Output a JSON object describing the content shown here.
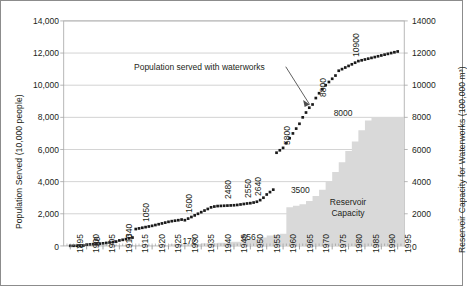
{
  "chart_data": {
    "type": "line",
    "title": "",
    "xlabel": "",
    "ylabel": "Population Served (10,000 people)",
    "y2label": "Reservoir Capacity for Waterworks (100,000 m³)",
    "xlim": [
      1893,
      1997
    ],
    "ylim": [
      0,
      14000
    ],
    "y2lim": [
      0,
      14000
    ],
    "grid": true,
    "legend_position": "none",
    "xticks": [
      "1895",
      "1900",
      "1905",
      "1910",
      "1915",
      "1920",
      "1925",
      "1930",
      "1935",
      "1940",
      "1945",
      "1950",
      "1955",
      "1960",
      "1965",
      "1970",
      "1975",
      "1980",
      "1985",
      "1990",
      "1995"
    ],
    "yticks_left": [
      "0",
      "2,000",
      "4,000",
      "6,000",
      "8,000",
      "10,000",
      "12,000",
      "14,000"
    ],
    "yticks_right": [
      "0",
      "2000",
      "4000",
      "6000",
      "8000",
      "10000",
      "12000",
      "14000"
    ],
    "annotations": [
      {
        "name": "series-callout",
        "text": "Population served with waterworks"
      },
      {
        "name": "area-label",
        "text": "Reservoir Capacity"
      }
    ],
    "series": [
      {
        "name": "Population served with waterworks",
        "type": "scatter",
        "marker": "square",
        "color": "#1a1a1a",
        "x": [
          1895,
          1896,
          1897,
          1898,
          1899,
          1900,
          1901,
          1902,
          1903,
          1904,
          1905,
          1906,
          1907,
          1908,
          1909,
          1910,
          1911,
          1912,
          1913,
          1914,
          1915,
          1916,
          1917,
          1918,
          1919,
          1920,
          1921,
          1922,
          1923,
          1924,
          1925,
          1926,
          1927,
          1928,
          1929,
          1930,
          1931,
          1932,
          1933,
          1934,
          1935,
          1936,
          1937,
          1938,
          1939,
          1940,
          1941,
          1942,
          1943,
          1944,
          1945,
          1946,
          1947,
          1948,
          1949,
          1950,
          1951,
          1952,
          1953,
          1954,
          1955,
          1956,
          1957,
          1958,
          1959,
          1960,
          1961,
          1962,
          1963,
          1964,
          1965,
          1966,
          1967,
          1968,
          1969,
          1970,
          1971,
          1972,
          1973,
          1974,
          1975,
          1976,
          1977,
          1978,
          1979,
          1980,
          1981,
          1982,
          1983,
          1984,
          1985,
          1986,
          1987,
          1988,
          1989,
          1990,
          1991,
          1992,
          1993,
          1994,
          1995
        ],
        "y": [
          7,
          10,
          14,
          20,
          28,
          80,
          95,
          110,
          125,
          140,
          160,
          185,
          210,
          240,
          270,
          340,
          380,
          420,
          470,
          520,
          1050,
          1090,
          1130,
          1170,
          1210,
          1250,
          1300,
          1350,
          1400,
          1450,
          1500,
          1540,
          1570,
          1600,
          1640,
          1600,
          1700,
          1800,
          1900,
          2000,
          2100,
          2200,
          2300,
          2400,
          2450,
          2480,
          2490,
          2500,
          2510,
          2520,
          2530,
          2550,
          2580,
          2610,
          2640,
          2660,
          2700,
          2750,
          2850,
          3000,
          3200,
          3350,
          3500,
          5800,
          5950,
          6100,
          6400,
          6700,
          7000,
          7300,
          7600,
          8000,
          8300,
          8600,
          8800,
          9200,
          9500,
          9750,
          10000,
          10200,
          10400,
          10600,
          10900,
          11000,
          11100,
          11200,
          11300,
          11400,
          11500,
          11550,
          11600,
          11650,
          11700,
          11750,
          11800,
          11850,
          11900,
          11950,
          12000,
          12050,
          12100
        ]
      },
      {
        "name": "Reservoir Capacity",
        "type": "area-step",
        "color": "#d9d9d9",
        "x": [
          1917,
          1925,
          1935,
          1940,
          1943,
          1948,
          1952,
          1955,
          1957,
          1959,
          1961,
          1963,
          1965,
          1967,
          1969,
          1971,
          1973,
          1975,
          1977,
          1979,
          1981,
          1983,
          1985,
          1987,
          1989,
          1991,
          1993,
          1995
        ],
        "y": [
          60,
          100,
          172,
          200,
          260,
          400,
          520,
          656,
          700,
          760,
          2400,
          2500,
          2600,
          2800,
          3100,
          3500,
          4000,
          4600,
          5200,
          5900,
          6500,
          7200,
          7800,
          8000,
          8000,
          8000,
          8000,
          8000
        ]
      }
    ],
    "point_labels": [
      {
        "name": "point-label-7",
        "value": "7",
        "year": 1895,
        "orient": "vertical"
      },
      {
        "name": "point-label-80",
        "value": "80",
        "year": 1900,
        "orient": "vertical"
      },
      {
        "name": "point-label-340",
        "value": "340",
        "year": 1910,
        "orient": "vertical"
      },
      {
        "name": "point-label-1050",
        "value": "1050",
        "year": 1915,
        "orient": "vertical"
      },
      {
        "name": "point-label-1600",
        "value": "1600",
        "year": 1928,
        "orient": "vertical"
      },
      {
        "name": "point-label-2480",
        "value": "2480",
        "year": 1940,
        "orient": "vertical"
      },
      {
        "name": "point-label-2550",
        "value": "2550",
        "year": 1946,
        "orient": "vertical"
      },
      {
        "name": "point-label-2640",
        "value": "2640",
        "year": 1949,
        "orient": "vertical"
      },
      {
        "name": "point-label-3500",
        "value": "3500",
        "year": 1958,
        "orient": "horizontal"
      },
      {
        "name": "point-label-5800",
        "value": "5800",
        "year": 1958,
        "orient": "vertical"
      },
      {
        "name": "point-label-8800",
        "value": "8800",
        "year": 1969,
        "orient": "vertical"
      },
      {
        "name": "point-label-10900",
        "value": "10900",
        "year": 1979,
        "orient": "vertical"
      },
      {
        "name": "area-label-172",
        "value": "172",
        "year": 1931,
        "orient": "horizontal"
      },
      {
        "name": "area-label-656",
        "value": "656",
        "year": 1949,
        "orient": "horizontal"
      },
      {
        "name": "area-label-8000",
        "value": "8000",
        "year": 1979,
        "orient": "horizontal"
      }
    ]
  },
  "axis": {
    "left_title": "Population Served (10,000 people)",
    "right_title": "Reservoir Capacity for Waterworks (100,000 m³)"
  },
  "labels": {
    "callout": "Population served with waterworks",
    "reservoir_line1": "Reservoir",
    "reservoir_line2": "Capacity"
  }
}
